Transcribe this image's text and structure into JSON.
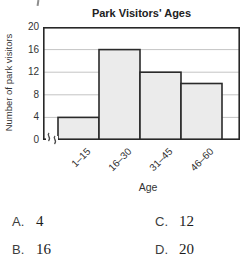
{
  "chart_data": {
    "type": "bar",
    "title": "Park Visitors' Ages",
    "xlabel": "Age",
    "ylabel": "Number of park visitors",
    "categories": [
      "1–15",
      "16–30",
      "31–45",
      "46–60"
    ],
    "values": [
      4,
      16,
      12,
      10
    ],
    "yticks": [
      0,
      4,
      8,
      12,
      16,
      20
    ],
    "ylim": [
      0,
      20
    ],
    "grid": true,
    "y_axis_break": true,
    "legend": null,
    "colors": {
      "bar_fill": "#ebebeb",
      "bar_border": "#2a2a2a",
      "gridline": "#c4c4c4",
      "frame": "#282828"
    }
  },
  "answers": [
    {
      "label": "A.",
      "value": "4"
    },
    {
      "label": "B.",
      "value": "16"
    },
    {
      "label": "C.",
      "value": "12"
    },
    {
      "label": "D.",
      "value": "20"
    }
  ]
}
